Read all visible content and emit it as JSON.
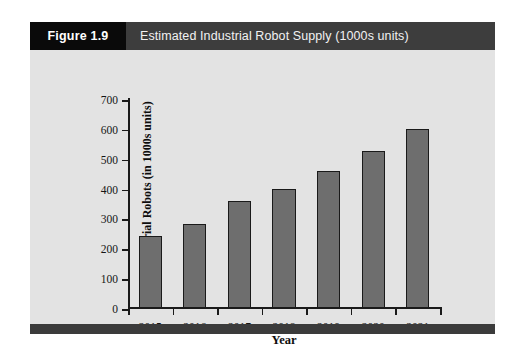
{
  "figure": {
    "number_label": "Figure 1.9",
    "title": "Estimated Industrial Robot Supply (1000s units)"
  },
  "colors": {
    "figure_number_bg": "#0a0a0a",
    "figure_title_bg": "#3d3d3d",
    "panel_bg": "#e3e3e3",
    "bar_fill": "#6e6e6e",
    "bar_stroke": "#1a1a1a",
    "footer_rule": "#3b3b3b"
  },
  "chart_data": {
    "type": "bar",
    "title": "Estimated Industrial Robot Supply (1000s units)",
    "xlabel": "Year",
    "ylabel": "Industrial Robots (in 1000s units)",
    "categories": [
      "2015",
      "2016",
      "2017",
      "2018",
      "2019",
      "2020",
      "2021"
    ],
    "values": [
      240,
      280,
      360,
      400,
      460,
      525,
      600
    ],
    "ylim": [
      0,
      700
    ],
    "ytick_values": [
      0,
      100,
      200,
      300,
      400,
      500,
      600,
      700
    ],
    "ytick_labels": [
      "0",
      "100",
      "200",
      "300",
      "400",
      "500",
      "600",
      "700"
    ],
    "grid": false,
    "legend": false
  }
}
